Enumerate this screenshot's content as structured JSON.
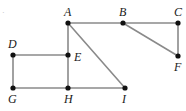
{
  "figure": {
    "width": 186,
    "height": 111,
    "background_color": "#ffffff",
    "edge_color": "#8a8a8a",
    "vertex_color": "#111111",
    "label_color": "#1a1a1a",
    "edge_width": 1.6,
    "vertex_radius": 2.6,
    "corner_mark": "·"
  },
  "chart_data": {
    "type": "diagram",
    "subtype": "undirected-graph",
    "title": "",
    "vertices": [
      {
        "id": "A",
        "label": "A",
        "x": 68,
        "y": 23,
        "label_x": 64,
        "label_y": 6,
        "label_pos": "above"
      },
      {
        "id": "B",
        "label": "B",
        "x": 123,
        "y": 23,
        "label_x": 119,
        "label_y": 6,
        "label_pos": "above"
      },
      {
        "id": "C",
        "label": "C",
        "x": 178,
        "y": 23,
        "label_x": 174,
        "label_y": 6,
        "label_pos": "above"
      },
      {
        "id": "D",
        "label": "D",
        "x": 13,
        "y": 55,
        "label_x": 8,
        "label_y": 38,
        "label_pos": "above"
      },
      {
        "id": "E",
        "label": "E",
        "x": 68,
        "y": 55,
        "label_x": 74,
        "label_y": 51,
        "label_pos": "right"
      },
      {
        "id": "F",
        "label": "F",
        "x": 178,
        "y": 56,
        "label_x": 174,
        "label_y": 61,
        "label_pos": "below"
      },
      {
        "id": "G",
        "label": "G",
        "x": 13,
        "y": 88,
        "label_x": 8,
        "label_y": 93,
        "label_pos": "below"
      },
      {
        "id": "H",
        "label": "H",
        "x": 68,
        "y": 88,
        "label_x": 64,
        "label_y": 93,
        "label_pos": "below"
      },
      {
        "id": "I",
        "label": "I",
        "x": 125,
        "y": 88,
        "label_x": 122,
        "label_y": 93,
        "label_pos": "below"
      }
    ],
    "edges": [
      {
        "from": "A",
        "to": "B"
      },
      {
        "from": "B",
        "to": "C"
      },
      {
        "from": "B",
        "to": "F"
      },
      {
        "from": "C",
        "to": "F"
      },
      {
        "from": "A",
        "to": "E"
      },
      {
        "from": "A",
        "to": "I"
      },
      {
        "from": "D",
        "to": "E"
      },
      {
        "from": "D",
        "to": "G"
      },
      {
        "from": "E",
        "to": "H"
      },
      {
        "from": "G",
        "to": "H"
      },
      {
        "from": "H",
        "to": "I"
      }
    ]
  }
}
